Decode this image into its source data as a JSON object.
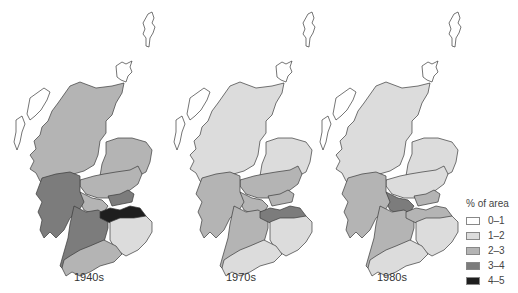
{
  "figure": {
    "maps": [
      {
        "label": "1940s",
        "regions": {
          "north_highland": "2-3",
          "northeast": "2-3",
          "tayside": "2-3",
          "central": "2-3",
          "west_argyll": "3-4",
          "fife": "3-4",
          "strathclyde_south": "3-4",
          "lothian": "4-5",
          "borders": "1-2",
          "dumfries_galloway": "2-3",
          "islands": "0-1"
        }
      },
      {
        "label": "1970s",
        "regions": {
          "north_highland": "1-2",
          "northeast": "1-2",
          "tayside": "2-3",
          "central": "2-3",
          "west_argyll": "2-3",
          "fife": "2-3",
          "strathclyde_south": "2-3",
          "lothian": "3-4",
          "borders": "1-2",
          "dumfries_galloway": "1-2",
          "islands": "0-1"
        }
      },
      {
        "label": "1980s",
        "regions": {
          "north_highland": "1-2",
          "northeast": "1-2",
          "tayside": "1-2",
          "central": "3-4",
          "west_argyll": "2-3",
          "fife": "2-3",
          "strathclyde_south": "2-3",
          "lothian": "2-3",
          "borders": "1-2",
          "dumfries_galloway": "1-2",
          "islands": "0-1"
        }
      }
    ],
    "legend": {
      "title": "% of area",
      "items": [
        {
          "label": "0–1",
          "key": "0-1",
          "color": "#ffffff"
        },
        {
          "label": "1–2",
          "key": "1-2",
          "color": "#dcdcdc"
        },
        {
          "label": "2–3",
          "key": "2-3",
          "color": "#b4b4b4"
        },
        {
          "label": "3–4",
          "key": "3-4",
          "color": "#7c7c7c"
        },
        {
          "label": "4–5",
          "key": "4-5",
          "color": "#1e1e1e"
        }
      ]
    }
  }
}
